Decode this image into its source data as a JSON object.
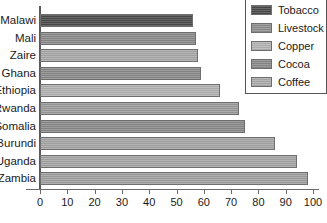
{
  "chart_data": {
    "type": "bar",
    "orientation": "horizontal",
    "title": "",
    "xlabel": "",
    "ylabel": "",
    "xlim": [
      0,
      100
    ],
    "grid": false,
    "legend_position": "top-right",
    "categories": [
      "Malawi",
      "Mali",
      "Zaire",
      "Ghana",
      "Ethiopia",
      "Rwanda",
      "Somalia",
      "Burundi",
      "Uganda",
      "Zambia"
    ],
    "values": [
      56,
      57,
      58,
      59,
      66,
      73,
      75,
      86,
      94,
      98
    ],
    "xticks": [
      0,
      10,
      20,
      30,
      40,
      50,
      60,
      70,
      80,
      90,
      100
    ],
    "xticklabels": [
      "0",
      "10",
      "20",
      "30",
      "40",
      "50",
      "60",
      "70",
      "80",
      "90",
      "100"
    ],
    "bar_commodity": [
      "Tobacco",
      "Cocoa",
      "Copper",
      "Cocoa",
      "Coffee",
      "Livestock",
      "Cocoa",
      "Coffee",
      "Coffee",
      "Copper"
    ],
    "bar_colors": [
      "#4a4a4a",
      "#8a8a8a",
      "#a8a8a8",
      "#8a8a8a",
      "#b2b2b2",
      "#9b9b9b",
      "#8a8a8a",
      "#a5a5a5",
      "#a5a5a5",
      "#a0a0a0"
    ],
    "series": [
      {
        "name": "Share of total export earnings (%)",
        "values": [
          56,
          57,
          58,
          59,
          66,
          73,
          75,
          86,
          94,
          98
        ]
      }
    ]
  },
  "legend": {
    "items": [
      {
        "label": "Tobacco",
        "color": "#4a4a4a"
      },
      {
        "label": "Livestock",
        "color": "#8f8f8f"
      },
      {
        "label": "Copper",
        "color": "#b4b4b4"
      },
      {
        "label": "Cocoa",
        "color": "#8a8a8a"
      },
      {
        "label": "Coffee",
        "color": "#ababab"
      }
    ]
  }
}
